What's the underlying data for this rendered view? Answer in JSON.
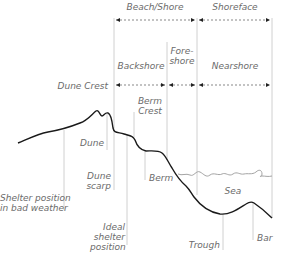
{
  "diagram": {
    "zones_top": [
      {
        "label": "Beach/Shore",
        "from_x": 114,
        "to_x": 197
      },
      {
        "label": "Shoreface",
        "from_x": 197,
        "to_x": 272
      }
    ],
    "zones_mid": [
      {
        "label": "Backshore",
        "from_x": 114,
        "to_x": 167
      },
      {
        "label": "Fore-",
        "label2": "shore",
        "from_x": 167,
        "to_x": 197
      },
      {
        "label": "Nearshore",
        "from_x": 197,
        "to_x": 272
      }
    ],
    "labels": {
      "dune_crest": "Dune Crest",
      "berm_crest_1": "Berm",
      "berm_crest_2": "Crest",
      "dune": "Dune",
      "dune_scarp_1": "Dune",
      "dune_scarp_2": "scarp",
      "berm": "Berm",
      "sea": "Sea",
      "shelter_bad_1": "Shelter position",
      "shelter_bad_2": "in bad weather",
      "ideal_1": "Ideal",
      "ideal_2": "shelter",
      "ideal_3": "position",
      "trough": "Trough",
      "bar": "Bar"
    },
    "colors": {
      "profile_line": "#1a1a1a",
      "guide_line": "#bdbdbd",
      "label_text": "#6b6b6b",
      "sea_line": "#9a9a9a"
    }
  }
}
